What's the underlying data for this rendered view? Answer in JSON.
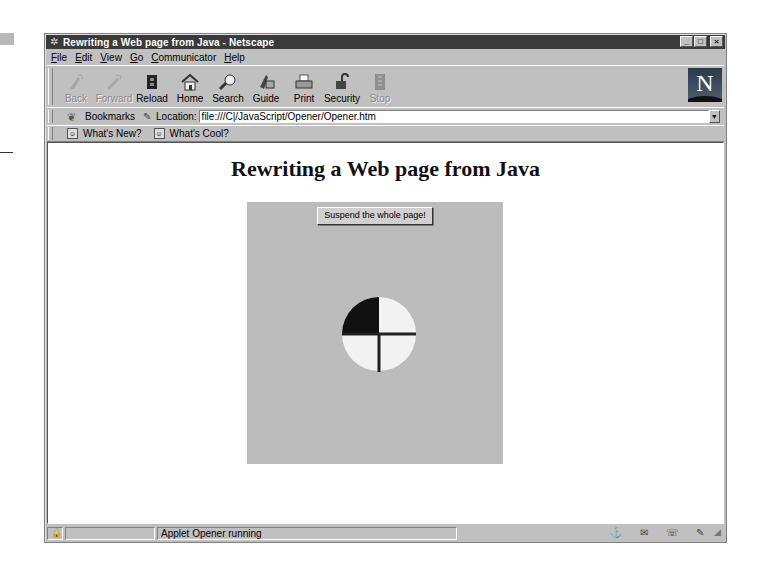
{
  "window": {
    "title": "Rewriting a Web page from Java - Netscape",
    "controls": {
      "minimize": "_",
      "maximize": "□",
      "close": "×"
    }
  },
  "menubar": {
    "items": [
      {
        "accel": "F",
        "rest": "ile"
      },
      {
        "accel": "E",
        "rest": "dit"
      },
      {
        "accel": "V",
        "rest": "iew"
      },
      {
        "accel": "G",
        "rest": "o"
      },
      {
        "accel": "C",
        "rest": "ommunicator"
      },
      {
        "accel": "H",
        "rest": "elp"
      }
    ]
  },
  "toolbar": {
    "buttons": [
      {
        "label": "Back",
        "icon": "back-arrow-icon",
        "enabled": false
      },
      {
        "label": "Forward",
        "icon": "forward-arrow-icon",
        "enabled": false
      },
      {
        "label": "Reload",
        "icon": "reload-icon",
        "enabled": true
      },
      {
        "label": "Home",
        "icon": "home-icon",
        "enabled": true
      },
      {
        "label": "Search",
        "icon": "search-icon",
        "enabled": true
      },
      {
        "label": "Guide",
        "icon": "guide-icon",
        "enabled": true
      },
      {
        "label": "Print",
        "icon": "print-icon",
        "enabled": true
      },
      {
        "label": "Security",
        "icon": "security-lock-icon",
        "enabled": true
      },
      {
        "label": "Stop",
        "icon": "stop-icon",
        "enabled": false
      }
    ],
    "logo": "N"
  },
  "location_bar": {
    "bookmarks_label": "Bookmarks",
    "location_label": "Location:",
    "url": "file:///C|/JavaScript/Opener/Opener.htm"
  },
  "personal_toolbar": {
    "items": [
      {
        "label": "What's New?"
      },
      {
        "label": "What's Cool?"
      }
    ]
  },
  "page": {
    "heading": "Rewriting a Web page from Java",
    "applet": {
      "button_label": "Suspend the whole page!",
      "background": "#bcbcbc",
      "clock": {
        "filled_quadrant": "top-left",
        "fill_color": "#111111",
        "face_color": "#f2f2f2"
      }
    }
  },
  "statusbar": {
    "message": "Applet Opener running"
  }
}
